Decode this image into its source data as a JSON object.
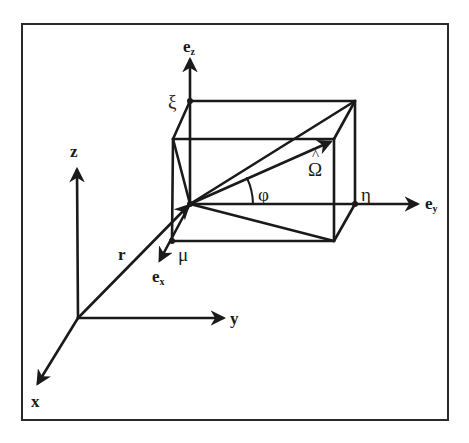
{
  "figure": {
    "stroke_color": "#1a1a1a",
    "background": "#ffffff"
  },
  "global_frame": {
    "origin": [
      78,
      318
    ],
    "axes": [
      {
        "name": "x",
        "label": "x",
        "tip": [
          37,
          385
        ]
      },
      {
        "name": "y",
        "label": "y",
        "tip": [
          225,
          318
        ]
      },
      {
        "name": "z",
        "label": "z",
        "tip": [
          77,
          168
        ]
      }
    ],
    "position_vector": {
      "label": "r",
      "from": [
        78,
        318
      ],
      "to": [
        190,
        204
      ]
    }
  },
  "local_frame": {
    "origin": [
      190,
      204
    ],
    "axes": [
      {
        "name": "ex",
        "base": "e",
        "sub": "x",
        "tip": [
          159,
          262
        ]
      },
      {
        "name": "ey",
        "base": "e",
        "sub": "y",
        "tip": [
          419,
          204
        ]
      },
      {
        "name": "ez",
        "base": "e",
        "sub": "z",
        "tip": [
          190,
          58
        ]
      }
    ]
  },
  "direction_cosines": {
    "mu": "μ",
    "eta": "η",
    "xi": "ξ"
  },
  "direction_vector": {
    "label": "Ω",
    "hat": "^",
    "angle_label": "φ"
  },
  "labels": {
    "x": "x",
    "y": "y",
    "z": "z",
    "r": "r",
    "e": "e",
    "sub_x": "x",
    "sub_y": "y",
    "sub_z": "z",
    "mu": "μ",
    "eta": "η",
    "xi": "ξ",
    "phi": "φ",
    "omega": "Ω",
    "hat": "^"
  }
}
